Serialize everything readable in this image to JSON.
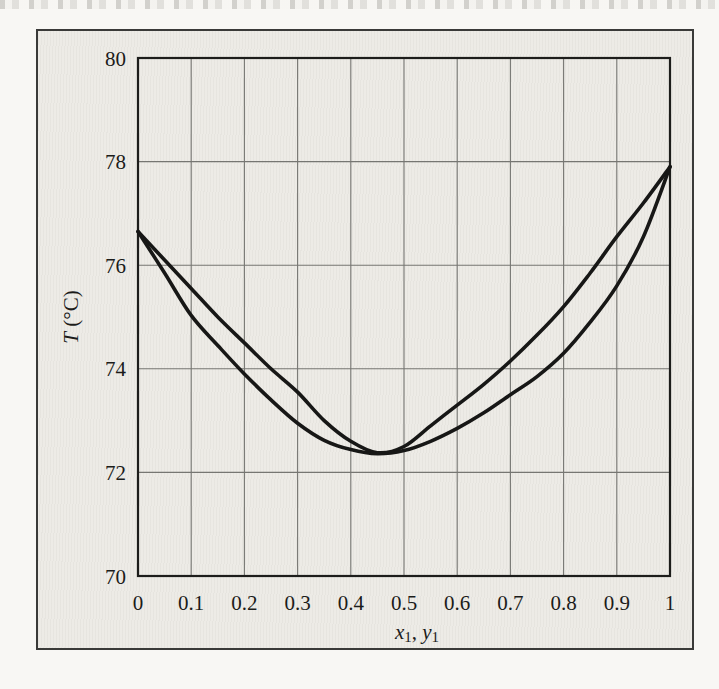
{
  "figure": {
    "y_axis": {
      "label_symbol": "T",
      "label_units": "(°C)",
      "tick_labels": [
        "80",
        "78",
        "76",
        "74",
        "72",
        "70"
      ]
    },
    "x_axis": {
      "label_x_symbol": "x",
      "label_x_subscript": "1",
      "label_separator": ", ",
      "label_y_symbol": "y",
      "label_y_subscript": "1",
      "tick_labels": [
        "0",
        "0.1",
        "0.2",
        "0.3",
        "0.4",
        "0.5",
        "0.6",
        "0.7",
        "0.8",
        "0.9",
        "1"
      ]
    }
  },
  "chart_data": {
    "type": "line",
    "title": "",
    "xlabel": "x₁, y₁",
    "ylabel": "T (°C)",
    "xlim": [
      0,
      1
    ],
    "ylim": [
      70,
      80
    ],
    "x_ticks": [
      0,
      0.1,
      0.2,
      0.3,
      0.4,
      0.5,
      0.6,
      0.7,
      0.8,
      0.9,
      1
    ],
    "y_ticks": [
      70,
      72,
      74,
      76,
      78,
      80
    ],
    "grid": true,
    "legend": "none",
    "line_color": "#171716",
    "x": [
      0,
      0.05,
      0.1,
      0.15,
      0.2,
      0.25,
      0.3,
      0.35,
      0.4,
      0.45,
      0.5,
      0.55,
      0.6,
      0.65,
      0.7,
      0.75,
      0.8,
      0.85,
      0.9,
      0.95,
      1
    ],
    "series": [
      {
        "id": "dew-curve",
        "name": "dew-point curve (upper, T vs y1)",
        "values": [
          76.65,
          76.1,
          75.55,
          75.0,
          74.5,
          74.0,
          73.55,
          73.0,
          72.6,
          72.38,
          72.5,
          72.9,
          73.3,
          73.7,
          74.15,
          74.65,
          75.2,
          75.85,
          76.55,
          77.2,
          77.9
        ]
      },
      {
        "id": "bubble-curve",
        "name": "bubble-point curve (lower, T vs x1)",
        "values": [
          76.65,
          75.85,
          75.03,
          74.45,
          73.9,
          73.4,
          72.95,
          72.62,
          72.44,
          72.36,
          72.42,
          72.6,
          72.85,
          73.15,
          73.5,
          73.85,
          74.3,
          74.9,
          75.6,
          76.55,
          77.9
        ]
      }
    ]
  }
}
